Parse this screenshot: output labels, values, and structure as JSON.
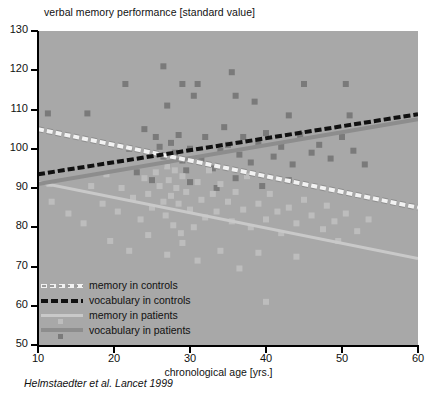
{
  "chart_data": {
    "type": "scatter",
    "title": "verbal memory performance [standard value]",
    "xlabel": "chronological age [yrs.]",
    "ylabel": "verbal memory performance [standard value]",
    "caption": "Helmstaedter et al. Lancet 1999",
    "xlim": [
      10,
      60
    ],
    "ylim": [
      50,
      130
    ],
    "xticks": [
      10,
      20,
      30,
      40,
      50,
      60
    ],
    "yticks": [
      50,
      60,
      70,
      80,
      90,
      100,
      110,
      120,
      130
    ],
    "grid": false,
    "legend_position": "bottom-left",
    "plot_background": "#a8a8a8",
    "colors": {
      "memory_controls_line": "#f2f2f2",
      "vocabulary_controls_line": "#111111",
      "memory_patients_line": "#c9c9c9",
      "vocabulary_patients_line": "#8d8d8d",
      "memory_patients_marker": "#bdbdbd",
      "vocabulary_patients_marker": "#7a7a7a"
    },
    "legend": [
      {
        "label": "memory in controls",
        "style": "dashed-hollow",
        "color": "#f2f2f2"
      },
      {
        "label": "vocabulary in controls",
        "style": "dashed-black",
        "color": "#111111"
      },
      {
        "label": "memory in patients",
        "style": "solid-light-with-marker",
        "color": "#c9c9c9"
      },
      {
        "label": "vocabulary in patients",
        "style": "solid-dark-with-marker",
        "color": "#8d8d8d"
      }
    ],
    "trend_lines": [
      {
        "name": "memory in controls",
        "x": [
          10,
          60
        ],
        "y": [
          105.0,
          85.0
        ]
      },
      {
        "name": "vocabulary in controls",
        "x": [
          10,
          60
        ],
        "y": [
          93.5,
          108.8
        ]
      },
      {
        "name": "memory in patients",
        "x": [
          10,
          60
        ],
        "y": [
          91.5,
          72.0
        ]
      },
      {
        "name": "vocabulary in patients",
        "x": [
          10,
          60
        ],
        "y": [
          91.0,
          107.5
        ]
      }
    ],
    "series": [
      {
        "name": "vocabulary in patients",
        "marker": "square",
        "color": "#7a7a7a",
        "points": [
          [
            11.3,
            109.0
          ],
          [
            16.5,
            109.0
          ],
          [
            21.5,
            116.5
          ],
          [
            26.5,
            121.0
          ],
          [
            27.0,
            111.0
          ],
          [
            29.0,
            116.5
          ],
          [
            30.5,
            113.5
          ],
          [
            31.0,
            116.5
          ],
          [
            35.5,
            119.5
          ],
          [
            36.0,
            113.5
          ],
          [
            38.5,
            112.0
          ],
          [
            43.0,
            108.5
          ],
          [
            45.0,
            116.5
          ],
          [
            50.5,
            116.5
          ],
          [
            51.0,
            108.5
          ],
          [
            24.0,
            105.0
          ],
          [
            25.5,
            103.0
          ],
          [
            26.0,
            100.5
          ],
          [
            26.5,
            98.0
          ],
          [
            27.0,
            96.0
          ],
          [
            27.5,
            101.5
          ],
          [
            28.0,
            99.0
          ],
          [
            28.5,
            103.5
          ],
          [
            29.0,
            97.0
          ],
          [
            29.5,
            94.5
          ],
          [
            30.0,
            100.0
          ],
          [
            31.5,
            97.5
          ],
          [
            32.0,
            103.0
          ],
          [
            33.0,
            95.0
          ],
          [
            34.0,
            99.5
          ],
          [
            34.5,
            105.5
          ],
          [
            35.0,
            101.0
          ],
          [
            36.5,
            98.5
          ],
          [
            37.0,
            103.0
          ],
          [
            38.0,
            96.5
          ],
          [
            39.0,
            101.5
          ],
          [
            40.0,
            104.0
          ],
          [
            41.0,
            98.0
          ],
          [
            42.0,
            100.5
          ],
          [
            43.5,
            96.0
          ],
          [
            44.5,
            103.5
          ],
          [
            46.0,
            99.0
          ],
          [
            47.0,
            101.0
          ],
          [
            48.5,
            97.5
          ],
          [
            50.0,
            103.0
          ],
          [
            51.5,
            99.5
          ],
          [
            53.0,
            96.0
          ],
          [
            22.0,
            100.0
          ],
          [
            23.0,
            94.0
          ],
          [
            25.0,
            92.0
          ],
          [
            30.0,
            91.5
          ],
          [
            33.5,
            90.0
          ],
          [
            36.0,
            92.5
          ],
          [
            39.5,
            90.5
          ],
          [
            43.0,
            92.0
          ]
        ]
      },
      {
        "name": "memory in patients",
        "marker": "square",
        "color": "#bdbdbd",
        "points": [
          [
            11.5,
            91.0
          ],
          [
            11.8,
            86.5
          ],
          [
            14.0,
            83.5
          ],
          [
            16.0,
            81.0
          ],
          [
            18.5,
            86.0
          ],
          [
            20.5,
            84.0
          ],
          [
            21.0,
            90.0
          ],
          [
            22.5,
            87.5
          ],
          [
            23.5,
            82.0
          ],
          [
            24.0,
            92.5
          ],
          [
            24.5,
            88.5
          ],
          [
            25.0,
            85.0
          ],
          [
            25.5,
            94.0
          ],
          [
            26.0,
            90.5
          ],
          [
            26.5,
            86.5
          ],
          [
            26.8,
            83.0
          ],
          [
            27.0,
            95.5
          ],
          [
            27.2,
            92.0
          ],
          [
            27.5,
            88.0
          ],
          [
            27.8,
            80.5
          ],
          [
            28.0,
            94.5
          ],
          [
            28.2,
            90.0
          ],
          [
            28.5,
            86.0
          ],
          [
            28.8,
            78.5
          ],
          [
            29.0,
            93.0
          ],
          [
            29.5,
            89.0
          ],
          [
            30.0,
            84.5
          ],
          [
            30.5,
            80.0
          ],
          [
            31.0,
            91.5
          ],
          [
            31.5,
            87.0
          ],
          [
            32.0,
            82.5
          ],
          [
            32.5,
            94.5
          ],
          [
            33.0,
            88.5
          ],
          [
            33.5,
            84.0
          ],
          [
            34.0,
            91.0
          ],
          [
            35.0,
            86.5
          ],
          [
            35.5,
            81.5
          ],
          [
            36.0,
            89.0
          ],
          [
            37.0,
            84.5
          ],
          [
            37.5,
            93.0
          ],
          [
            38.0,
            80.0
          ],
          [
            39.0,
            86.0
          ],
          [
            40.0,
            82.0
          ],
          [
            40.5,
            88.5
          ],
          [
            41.5,
            84.0
          ],
          [
            42.0,
            78.5
          ],
          [
            43.0,
            85.0
          ],
          [
            44.0,
            81.0
          ],
          [
            45.0,
            87.0
          ],
          [
            46.0,
            83.0
          ],
          [
            47.5,
            79.5
          ],
          [
            48.0,
            85.5
          ],
          [
            49.0,
            81.5
          ],
          [
            50.5,
            83.5
          ],
          [
            52.0,
            79.0
          ],
          [
            53.5,
            82.0
          ],
          [
            27.0,
            73.0
          ],
          [
            29.0,
            76.0
          ],
          [
            31.0,
            71.5
          ],
          [
            34.0,
            74.0
          ],
          [
            36.5,
            69.5
          ],
          [
            39.0,
            73.5
          ],
          [
            40.0,
            61.0
          ],
          [
            44.0,
            72.5
          ],
          [
            49.5,
            76.5
          ],
          [
            19.5,
            76.5
          ],
          [
            22.0,
            74.0
          ],
          [
            24.5,
            78.0
          ],
          [
            17.0,
            90.5
          ],
          [
            19.0,
            93.5
          ]
        ]
      }
    ]
  }
}
